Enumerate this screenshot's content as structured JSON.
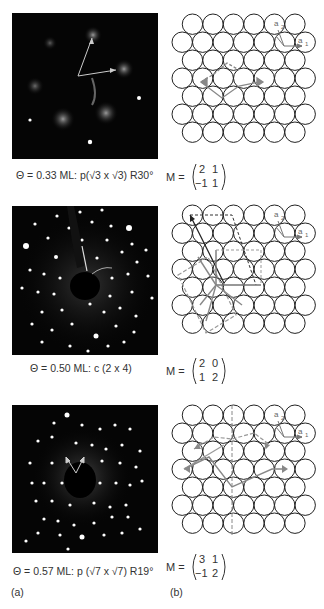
{
  "figure": {
    "panels": [
      {
        "id": "p1",
        "caption": "Θ = 0.33 ML: p(√3 x √3) R30°",
        "matrix": {
          "label": "M =",
          "m11": "2",
          "m12": "1",
          "m21": "−1",
          "m22": "1"
        },
        "lattice_labels": {
          "a1": "a",
          "a1_sub": "1",
          "a2": "a",
          "a2_sub": "2"
        }
      },
      {
        "id": "p2",
        "caption": "Θ = 0.50 ML: c (2 x 4)",
        "matrix": {
          "label": "M =",
          "m11": "2",
          "m12": "0",
          "m21": "1",
          "m22": "2"
        },
        "lattice_labels": {
          "a1": "a",
          "a1_sub": "1",
          "a2": "a",
          "a2_sub": "2"
        }
      },
      {
        "id": "p3",
        "caption": "Θ = 0.57 ML: p (√7 x √7) R19°",
        "matrix": {
          "label": "M =",
          "m11": "3",
          "m12": "1",
          "m21": "−1",
          "m22": "2"
        },
        "lattice_labels": {
          "a1": "a",
          "a1_sub": "1",
          "a2": "a",
          "a2_sub": "2"
        }
      }
    ],
    "column_labels": {
      "left": "(a)",
      "right": "(b)"
    },
    "colors": {
      "leed_bg": "#050505",
      "spot": "#ffffff",
      "circle_stroke": "#222222",
      "vector_gray": "#888888",
      "vector_dark": "#222222"
    }
  }
}
